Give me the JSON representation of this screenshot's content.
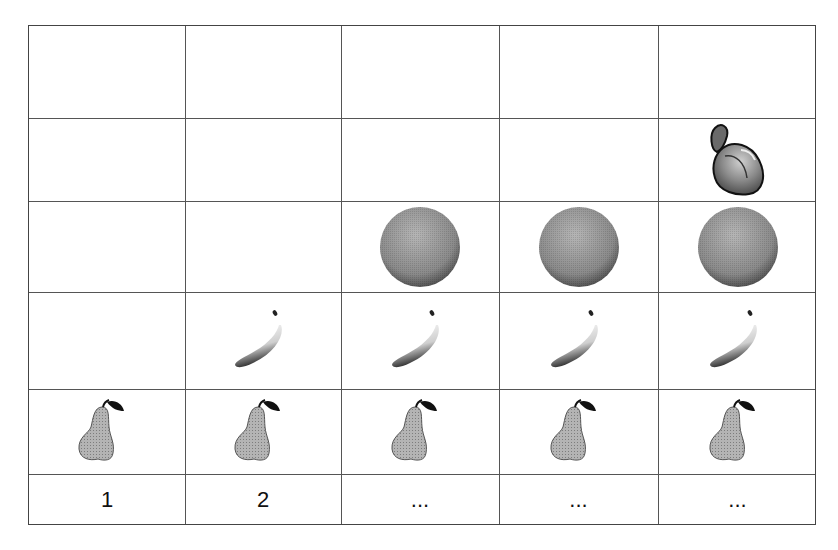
{
  "diagram": {
    "columns": 5,
    "rows": 6,
    "column_labels": [
      "1",
      "2",
      "...",
      "...",
      "..."
    ],
    "fruit_rows": [
      {
        "row": 1,
        "fruit": "peach",
        "icon": "peach-icon",
        "columns_filled": [
          5
        ]
      },
      {
        "row": 2,
        "fruit": "orange",
        "icon": "orange-icon",
        "columns_filled": [
          3,
          4,
          5
        ]
      },
      {
        "row": 3,
        "fruit": "banana",
        "icon": "banana-icon",
        "columns_filled": [
          2,
          3,
          4,
          5
        ]
      },
      {
        "row": 4,
        "fruit": "pear",
        "icon": "pear-icon",
        "columns_filled": [
          1,
          2,
          3,
          4,
          5
        ]
      }
    ],
    "colors": {
      "grid_line": "#555555",
      "pear_fill": "#a8a8a8",
      "orange_fill": "#8a8a8a",
      "banana_fill": "#d8d8d8",
      "peach_fill": "#7a7a7a"
    }
  }
}
